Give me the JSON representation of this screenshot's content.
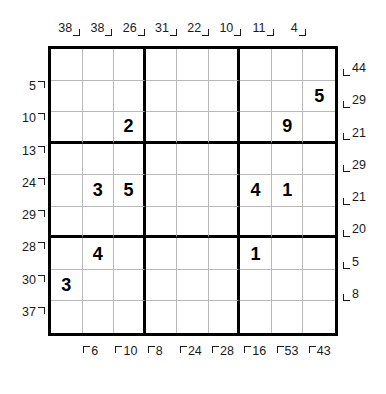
{
  "puzzle": {
    "type": "frame-sudoku",
    "size": 9,
    "box_rows": 3,
    "box_cols": 3,
    "grid_values": [
      [
        "",
        "",
        "",
        "",
        "",
        "",
        "",
        "",
        ""
      ],
      [
        "",
        "",
        "",
        "",
        "",
        "",
        "",
        "",
        "5"
      ],
      [
        "",
        "",
        "2",
        "",
        "",
        "",
        "",
        "9",
        ""
      ],
      [
        "",
        "",
        "",
        "",
        "",
        "",
        "",
        "",
        ""
      ],
      [
        "",
        "3",
        "5",
        "",
        "",
        "",
        "4",
        "1",
        ""
      ],
      [
        "",
        "",
        "",
        "",
        "",
        "",
        "",
        "",
        ""
      ],
      [
        "",
        "4",
        "",
        "",
        "",
        "",
        "1",
        "",
        ""
      ],
      [
        "3",
        "",
        "",
        "",
        "",
        "",
        "",
        "",
        ""
      ],
      [
        "",
        "",
        "",
        "",
        "",
        "",
        "",
        "",
        ""
      ]
    ],
    "clues": {
      "top": [
        "38",
        "38",
        "26",
        "31",
        "22",
        "10",
        "11",
        "4",
        ""
      ],
      "left": [
        "",
        "5",
        "10",
        "13",
        "24",
        "29",
        "28",
        "30",
        "37"
      ],
      "right": [
        "44",
        "29",
        "21",
        "29",
        "21",
        "20",
        "5",
        "8",
        ""
      ],
      "bottom": [
        "",
        "6",
        "10",
        "8",
        "24",
        "28",
        "16",
        "53",
        "43"
      ]
    },
    "colors": {
      "ink": "#1a1a1a",
      "grid_thick": "#000000",
      "grid_thin": "#b9b9b9",
      "background": "#ffffff"
    }
  }
}
